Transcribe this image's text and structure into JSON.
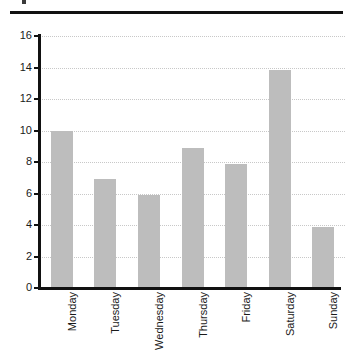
{
  "chart_data": {
    "type": "bar",
    "title": "",
    "xlabel": "",
    "ylabel": "",
    "categories": [
      "Monday",
      "Tuesday",
      "Wednesday",
      "Thursday",
      "Friday",
      "Saturday",
      "Sunday"
    ],
    "values": [
      10.0,
      6.9,
      5.9,
      8.9,
      7.85,
      13.85,
      3.85
    ],
    "ylim": [
      0,
      16
    ],
    "ytick_labels": [
      "0",
      "2",
      "4",
      "6",
      "8",
      "10",
      "12",
      "14",
      "16"
    ],
    "ytick_values": [
      0,
      2,
      4,
      6,
      8,
      10,
      12,
      14,
      16
    ],
    "grid": "horizontal-dotted",
    "legend": "none",
    "bar_color": "#bdbdbd",
    "axis_color": "#111111",
    "grid_color": "#c8c8c8",
    "background": "#ffffff"
  },
  "decorations": {
    "top_rule_color": "#111111"
  }
}
